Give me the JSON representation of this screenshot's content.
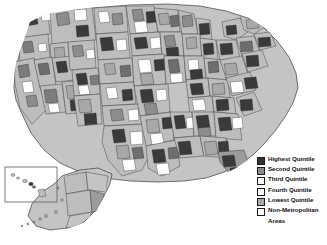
{
  "figure": {
    "type": "choropleth-map",
    "region": "United States",
    "unit": "county",
    "background_color": "#ffffff"
  },
  "legend": {
    "name": "map-legend",
    "items": [
      {
        "label": "Highest Quintile",
        "color": "#333333",
        "swatch": "solid-dark"
      },
      {
        "label": "Second Quintile",
        "color": "#8a8a8a",
        "swatch": "solid-medium-dark"
      },
      {
        "label": "Third Quintile",
        "color": "#ffffff",
        "swatch": "outline-white"
      },
      {
        "label": "Fourth Quintile",
        "color": "#ffffff",
        "swatch": "outline-white"
      },
      {
        "label": "Lowest Quintile",
        "color": "#a9a9a9",
        "swatch": "solid-medium"
      },
      {
        "label": "Non-Metropolitan",
        "label2": "Areas",
        "color": "#ffffff",
        "swatch": "outline-white"
      }
    ]
  },
  "insets": [
    {
      "name": "hawaii-inset",
      "label": ""
    },
    {
      "name": "alaska-inset",
      "label": ""
    }
  ],
  "palette": {
    "highest": "#333333",
    "second": "#8a8a8a",
    "third": "#ffffff",
    "fourth": "#ffffff",
    "lowest": "#a9a9a9",
    "non_metro": "#cfcfcf",
    "base_land": "#c4c4c4",
    "outline": "#3b3b3b"
  }
}
